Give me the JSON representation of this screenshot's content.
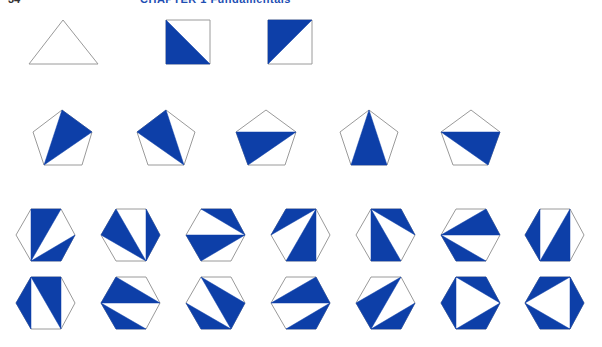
{
  "header": {
    "page_number": "34",
    "chapter_title": "CHAPTER 1   Fundamentals"
  },
  "colors": {
    "fill": "#0d3fa8",
    "outline": "#9a9a9a",
    "background": "#ffffff"
  },
  "figure": {
    "groups": [
      {
        "name": "triangle",
        "count": 1,
        "items": [
          {
            "outline": [
              [
                63,
                20
              ],
              [
                98,
                64
              ],
              [
                29,
                64
              ]
            ],
            "triangles": []
          }
        ]
      },
      {
        "name": "square",
        "count": 2,
        "items": [
          {
            "outline": [
              [
                166,
                20
              ],
              [
                210,
                20
              ],
              [
                210,
                64
              ],
              [
                166,
                64
              ]
            ],
            "triangles": [
              [
                [
                  166,
                  20
                ],
                [
                  210,
                  64
                ],
                [
                  166,
                  64
                ]
              ]
            ]
          },
          {
            "outline": [
              [
                268,
                20
              ],
              [
                312,
                20
              ],
              [
                312,
                64
              ],
              [
                268,
                64
              ]
            ],
            "triangles": [
              [
                [
                  268,
                  20
                ],
                [
                  312,
                  20
                ],
                [
                  268,
                  64
                ]
              ]
            ]
          }
        ]
      },
      {
        "name": "pentagon",
        "count": 5,
        "items": [
          {
            "outline": [
              [
                62,
                110
              ],
              [
                92,
                132
              ],
              [
                82,
                165
              ],
              [
                44,
                165
              ],
              [
                33,
                132
              ]
            ],
            "triangles": [
              [
                [
                  62,
                  110
                ],
                [
                  92,
                  132
                ],
                [
                  44,
                  165
                ]
              ]
            ]
          },
          {
            "outline": [
              [
                166,
                110
              ],
              [
                195,
                132
              ],
              [
                184,
                165
              ],
              [
                148,
                165
              ],
              [
                137,
                132
              ]
            ],
            "triangles": [
              [
                [
                  166,
                  110
                ],
                [
                  184,
                  165
                ],
                [
                  137,
                  132
                ]
              ]
            ]
          },
          {
            "outline": [
              [
                266,
                110
              ],
              [
                296,
                132
              ],
              [
                285,
                165
              ],
              [
                248,
                165
              ],
              [
                236,
                132
              ]
            ],
            "triangles": [
              [
                [
                  236,
                  132
                ],
                [
                  296,
                  132
                ],
                [
                  248,
                  165
                ]
              ]
            ]
          },
          {
            "outline": [
              [
                369,
                110
              ],
              [
                398,
                132
              ],
              [
                387,
                165
              ],
              [
                351,
                165
              ],
              [
                340,
                132
              ]
            ],
            "triangles": [
              [
                [
                  369,
                  110
                ],
                [
                  387,
                  165
                ],
                [
                  351,
                  165
                ]
              ]
            ]
          },
          {
            "outline": [
              [
                471,
                110
              ],
              [
                500,
                132
              ],
              [
                488,
                165
              ],
              [
                453,
                165
              ],
              [
                441,
                132
              ]
            ],
            "triangles": [
              [
                [
                  441,
                  132
                ],
                [
                  500,
                  132
                ],
                [
                  488,
                  165
                ]
              ]
            ]
          }
        ]
      },
      {
        "name": "hexagon",
        "count": 14,
        "columns_x": [
          16,
          101,
          186,
          271,
          356,
          441,
          525
        ],
        "rows_y": [
          209,
          277
        ],
        "width": 59,
        "height": 52,
        "items": [
          {
            "row": 0,
            "col": 0,
            "triangles": [
              [
                "TL",
                "TR",
                "BL"
              ],
              [
                "BL",
                "R",
                "BR"
              ]
            ]
          },
          {
            "row": 0,
            "col": 1,
            "triangles": [
              [
                "L",
                "TL",
                "BR"
              ],
              [
                "TR",
                "R",
                "BR"
              ]
            ]
          },
          {
            "row": 0,
            "col": 2,
            "triangles": [
              [
                "TL",
                "TR",
                "R"
              ],
              [
                "L",
                "R",
                "BL"
              ]
            ]
          },
          {
            "row": 0,
            "col": 3,
            "triangles": [
              [
                "TL",
                "TR",
                "L"
              ],
              [
                "TR",
                "BR",
                "BL"
              ]
            ]
          },
          {
            "row": 0,
            "col": 4,
            "triangles": [
              [
                "TL",
                "TR",
                "R"
              ],
              [
                "TL",
                "BR",
                "BL"
              ]
            ]
          },
          {
            "row": 0,
            "col": 5,
            "triangles": [
              [
                "L",
                "TR",
                "R"
              ],
              [
                "L",
                "BR",
                "BL"
              ]
            ]
          },
          {
            "row": 0,
            "col": 6,
            "triangles": [
              [
                "L",
                "TL",
                "BL"
              ],
              [
                "TR",
                "BR",
                "BL"
              ]
            ]
          },
          {
            "row": 1,
            "col": 0,
            "triangles": [
              [
                "L",
                "TL",
                "BL"
              ],
              [
                "TL",
                "TR",
                "BR"
              ]
            ]
          },
          {
            "row": 1,
            "col": 1,
            "triangles": [
              [
                "TL",
                "R",
                "L"
              ],
              [
                "L",
                "BR",
                "BL"
              ]
            ]
          },
          {
            "row": 1,
            "col": 2,
            "triangles": [
              [
                "TL",
                "R",
                "BR"
              ],
              [
                "L",
                "BR",
                "BL"
              ]
            ]
          },
          {
            "row": 1,
            "col": 3,
            "triangles": [
              [
                "L",
                "TR",
                "R"
              ],
              [
                "R",
                "BR",
                "BL"
              ]
            ]
          },
          {
            "row": 1,
            "col": 4,
            "triangles": [
              [
                "L",
                "TR",
                "BL"
              ],
              [
                "BL",
                "R",
                "BR"
              ]
            ]
          },
          {
            "row": 1,
            "col": 5,
            "triangles": [
              [
                "L",
                "TL",
                "BL"
              ],
              [
                "TL",
                "TR",
                "R"
              ],
              [
                "R",
                "BR",
                "BL"
              ]
            ]
          },
          {
            "row": 1,
            "col": 6,
            "triangles": [
              [
                "TL",
                "TR",
                "L"
              ],
              [
                "L",
                "BR",
                "BL"
              ],
              [
                "TR",
                "R",
                "BR"
              ]
            ]
          }
        ]
      }
    ]
  }
}
